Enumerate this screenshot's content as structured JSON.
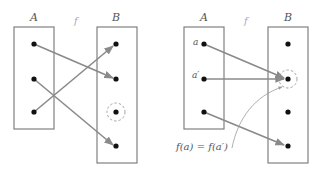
{
  "diagrams": [
    {
      "name": "non-injective-left",
      "set_a_label": "A",
      "set_b_label": "B",
      "function_label": "f",
      "domain_points": 3,
      "codomain_points": 4,
      "mappings": [
        [
          1,
          2
        ],
        [
          2,
          4
        ],
        [
          3,
          1
        ]
      ],
      "highlighted_codomain_point": 3
    },
    {
      "name": "non-injective-right",
      "set_a_label": "A",
      "set_b_label": "B",
      "function_label": "f",
      "point_labels": {
        "a": "a",
        "a_prime": "a′"
      },
      "annotation": "f(a) = f(a′)",
      "domain_points": 3,
      "codomain_points": 4,
      "mappings": [
        [
          1,
          2
        ],
        [
          2,
          2
        ],
        [
          3,
          4
        ]
      ],
      "highlighted_codomain_point": 2
    }
  ],
  "colors": {
    "box": "#808080",
    "arrow": "#8a8a8a",
    "dot": "#111111",
    "label": "#555555"
  }
}
